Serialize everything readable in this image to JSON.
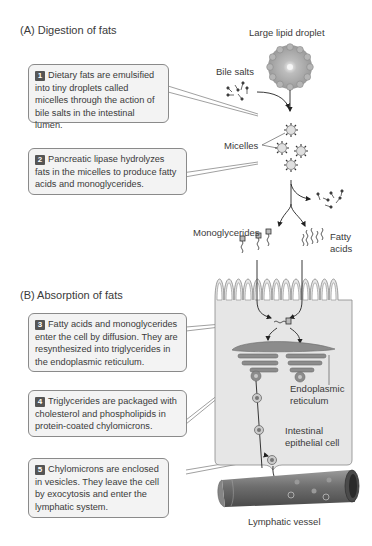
{
  "sections": {
    "a_title": "(A)  Digestion of fats",
    "b_title": "(B)  Absorption of fats"
  },
  "steps": [
    {
      "number": "1",
      "text": "Dietary fats are emulsified into tiny droplets called micelles through the action of bile salts in the intestinal lumen."
    },
    {
      "number": "2",
      "text": "Pancreatic lipase hydrolyzes fats in the micelles to produce fatty acids and monoglycerides."
    },
    {
      "number": "3",
      "text": "Fatty acids and monoglycerides enter the cell by diffusion. They are resynthesized into triglycerides in the endoplasmic reticulum."
    },
    {
      "number": "4",
      "text": "Triglycerides are packaged with cholesterol and phospholipids in protein-coated chylomicrons."
    },
    {
      "number": "5",
      "text": "Chylomicrons are enclosed in vesicles. They leave the cell by exocytosis and enter the lymphatic system."
    }
  ],
  "labels": {
    "large_lipid_droplet": "Large lipid droplet",
    "bile_salts": "Bile salts",
    "micelles": "Micelles",
    "monoglycerides": "Monoglycerides",
    "fatty_acids_1": "Fatty",
    "fatty_acids_2": "acids",
    "endoplasmic_1": "Endoplasmic",
    "endoplasmic_2": "reticulum",
    "epithelial_1": "Intestinal",
    "epithelial_2": "epithelial cell",
    "lymphatic_vessel": "Lymphatic vessel"
  },
  "colors": {
    "box_fill": "#f3f3f3",
    "box_border": "#8a8a8a",
    "cell_fill": "#e6e6e6",
    "er_fill": "#8c8c8c",
    "vessel_fill": "#7a7a7a",
    "number_badge": "#555555"
  }
}
